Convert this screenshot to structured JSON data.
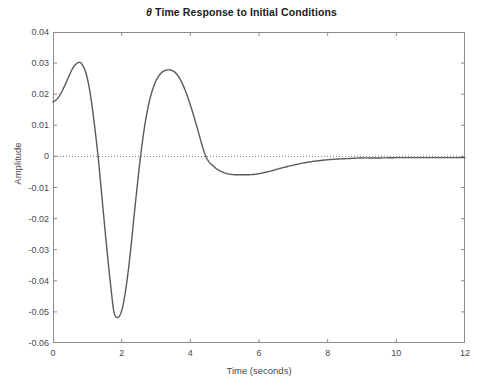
{
  "figure": {
    "title_theta": "θ",
    "title_rest": " Time Response to Initial Conditions",
    "caption": ""
  },
  "axes": {
    "ylabel": "Amplitude",
    "xlabel": "Time (seconds)",
    "xticks": [
      "0",
      "2",
      "4",
      "6",
      "8",
      "10",
      "12"
    ],
    "yticks": [
      "0.04",
      "0.03",
      "0.02",
      "0.01",
      "0",
      "-0.01",
      "-0.02",
      "-0.03",
      "-0.04",
      "-0.05",
      "-0.06"
    ]
  },
  "colors": {
    "curve": "#5a5a5a",
    "axis": "#8c8c8c",
    "zero_line": "#6b6b6b",
    "text": "#4a4a4a",
    "title": "#1b1b1b",
    "background": "#ffffff"
  },
  "chart_data": {
    "type": "line",
    "title": "θ Time Response to Initial Conditions",
    "xlabel": "Time (seconds)",
    "ylabel": "Amplitude",
    "xlim": [
      0,
      12
    ],
    "ylim": [
      -0.06,
      0.04
    ],
    "xticks": [
      0,
      2,
      4,
      6,
      8,
      10,
      12
    ],
    "yticks": [
      0.04,
      0.03,
      0.02,
      0.01,
      0,
      -0.01,
      -0.02,
      -0.03,
      -0.04,
      -0.05,
      -0.06
    ],
    "grid": false,
    "legend": "none",
    "zero_reference_line": {
      "y": 0,
      "style": "dotted"
    },
    "annotations": [],
    "series": [
      {
        "name": "theta",
        "color": "#5a5a5a",
        "initial_value": 0.0175,
        "features": [
          {
            "label": "start",
            "t": 0.0,
            "y": 0.0175
          },
          {
            "label": "peak-1",
            "t": 0.78,
            "y": 0.0302
          },
          {
            "label": "zero-crossing-1",
            "t": 1.2,
            "y": 0.0
          },
          {
            "label": "trough-1",
            "t": 1.78,
            "y": -0.0517
          },
          {
            "label": "zero-crossing-2",
            "t": 2.55,
            "y": 0.0
          },
          {
            "label": "peak-2",
            "t": 3.45,
            "y": 0.0277
          },
          {
            "label": "zero-crossing-3",
            "t": 4.45,
            "y": 0.0
          },
          {
            "label": "trough-2",
            "t": 5.85,
            "y": -0.0058
          },
          {
            "label": "settle",
            "t": 9.0,
            "y": -0.0005
          },
          {
            "label": "end",
            "t": 12.0,
            "y": -0.0004
          }
        ],
        "x": [
          0,
          0.12,
          0.24,
          0.36,
          0.48,
          0.6,
          0.72,
          0.78,
          0.84,
          0.96,
          1.08,
          1.2,
          1.32,
          1.44,
          1.56,
          1.68,
          1.78,
          1.9,
          2.02,
          2.14,
          2.26,
          2.38,
          2.55,
          2.7,
          2.85,
          3.0,
          3.15,
          3.3,
          3.45,
          3.6,
          3.75,
          3.9,
          4.05,
          4.2,
          4.45,
          4.7,
          4.95,
          5.2,
          5.45,
          5.85,
          6.2,
          6.6,
          7.0,
          7.4,
          7.8,
          8.2,
          8.6,
          9.0,
          9.5,
          10.0,
          10.5,
          11.0,
          11.5,
          12.0
        ],
        "y": [
          0.0175,
          0.0185,
          0.0205,
          0.0232,
          0.0262,
          0.0288,
          0.0301,
          0.0302,
          0.0297,
          0.0268,
          0.0205,
          0.0108,
          -0.0008,
          -0.0148,
          -0.0288,
          -0.0415,
          -0.0502,
          -0.0517,
          -0.0488,
          -0.0412,
          -0.0302,
          -0.0172,
          0.0,
          0.0118,
          0.0196,
          0.0243,
          0.0268,
          0.0277,
          0.0277,
          0.0265,
          0.0238,
          0.0198,
          0.0148,
          0.0092,
          0.0,
          -0.0034,
          -0.0051,
          -0.0058,
          -0.0059,
          -0.0058,
          -0.0051,
          -0.0039,
          -0.0028,
          -0.0019,
          -0.0013,
          -0.0009,
          -0.0007,
          -0.0005,
          -0.0005,
          -0.0004,
          -0.0004,
          -0.0004,
          -0.0004,
          -0.0004
        ]
      }
    ]
  }
}
